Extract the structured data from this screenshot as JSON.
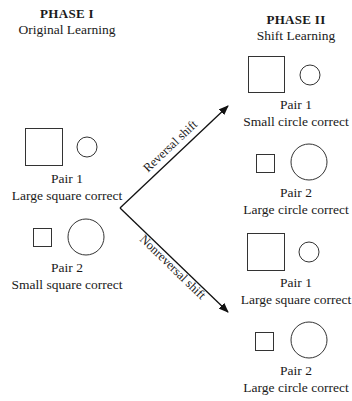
{
  "phase1": {
    "title": "PHASE I",
    "subtitle": "Original Learning",
    "pairs": [
      {
        "pair": "Pair 1",
        "rule": "Large square correct",
        "square": "large",
        "circle": "small"
      },
      {
        "pair": "Pair 2",
        "rule": "Small square correct",
        "square": "small",
        "circle": "large"
      }
    ]
  },
  "phase2": {
    "title": "PHASE II",
    "subtitle": "Shift Learning",
    "pairs": [
      {
        "pair": "Pair 1",
        "rule": "Small circle correct",
        "square": "large",
        "circle": "small",
        "group": "reversal"
      },
      {
        "pair": "Pair 2",
        "rule": "Large circle correct",
        "square": "small",
        "circle": "large",
        "group": "reversal"
      },
      {
        "pair": "Pair 1",
        "rule": "Large square correct",
        "square": "large",
        "circle": "small",
        "group": "nonreversal"
      },
      {
        "pair": "Pair 2",
        "rule": "Large circle correct",
        "square": "small",
        "circle": "large",
        "group": "nonreversal"
      }
    ]
  },
  "arrows": {
    "upper": "Reversal shift",
    "lower": "Nonreversal shift"
  },
  "colors": {
    "stroke": "#333333",
    "text": "#1a1a1a",
    "background": "#ffffff"
  }
}
